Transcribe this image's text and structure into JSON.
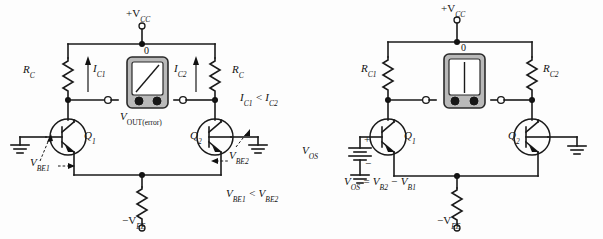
{
  "figure": {
    "kind": "electronics-schematic-pair"
  },
  "circuit_left": {
    "supply_top": "+V",
    "supply_top_sub": "CC",
    "supply_bottom": "−V",
    "supply_bottom_sub": "EE",
    "resistor_left": "R",
    "resistor_left_sub": "C",
    "resistor_right": "R",
    "resistor_right_sub": "C",
    "current_left": "I",
    "current_left_sub": "C1",
    "current_right": "I",
    "current_right_sub": "C2",
    "transistor_left": "Q",
    "transistor_left_sub": "1",
    "transistor_right": "Q",
    "transistor_right_sub": "2",
    "meter_zero": "0",
    "meter_label": "V",
    "meter_label_sub": "OUT(error)",
    "note_current": "I",
    "note_current_sub1": "C1",
    "note_current_op": " < I",
    "note_current_sub2": "C2",
    "note_vbe": "V",
    "note_vbe_sub1": "BE1",
    "note_vbe_op": " < V",
    "note_vbe_sub2": "BE2",
    "vbe_left": "V",
    "vbe_left_sub": "BE1",
    "vbe_right": "V",
    "vbe_right_sub": "BE2"
  },
  "circuit_right": {
    "supply_top": "+V",
    "supply_top_sub": "CC",
    "supply_bottom": "−V",
    "supply_bottom_sub": "EE",
    "resistor_left": "R",
    "resistor_left_sub": "C1",
    "resistor_right": "R",
    "resistor_right_sub": "C2",
    "transistor_left": "Q",
    "transistor_left_sub": "1",
    "transistor_right": "Q",
    "transistor_right_sub": "2",
    "meter_zero": "0",
    "source_label": "V",
    "source_label_sub": "OS",
    "source_plus": "+",
    "source_minus": "−",
    "equation_a": "V",
    "equation_a_sub": "OS",
    "equation_eq": " = V",
    "equation_b_sub": "B2",
    "equation_minus": " − V",
    "equation_c_sub": "B1"
  },
  "colors": {
    "wire": "#1a1a1a",
    "meter_case": "#b9b9b9",
    "meter_face": "#ffffff",
    "node": "#111111",
    "background": "#fdfdfd"
  }
}
